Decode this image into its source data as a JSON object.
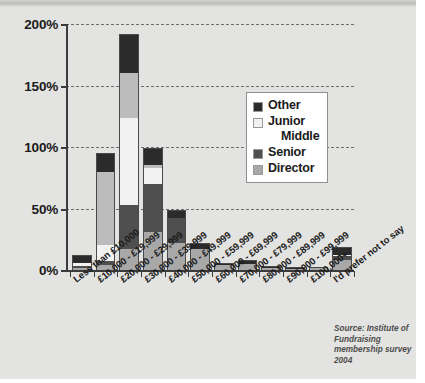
{
  "source_note": "Source: Institute of Fundraising membership survey 2004",
  "legend": {
    "title": "",
    "items": [
      {
        "label": "Other",
        "label_line2": "",
        "color": "#2b2b2b"
      },
      {
        "label": "Junior",
        "label_line2": "Middle",
        "color": "#f2f2f2"
      },
      {
        "label": "Senior",
        "label_line2": "",
        "color": "#4f4f4f"
      },
      {
        "label": "Director",
        "label_line2": "",
        "color": "#a8a8a8"
      }
    ]
  },
  "chart_data": {
    "type": "bar",
    "subtype": "stacked-bar",
    "title": "",
    "xlabel": "",
    "ylabel": "",
    "ylim": [
      0,
      200
    ],
    "ytick_labels": [
      "0%",
      "50%",
      "100%",
      "150%",
      "200%"
    ],
    "ytick_values": [
      0,
      50,
      100,
      150,
      200
    ],
    "grid": "horizontal-dashed",
    "legend_position": "inside-right",
    "categories": [
      "Less than £10,000",
      "£10,000 - £19,999",
      "£20,000 - £29,999",
      "£30,000 - £39,999",
      "£40,000 - £49,999",
      "£50,000 - £59,999",
      "£60,000 - £69,999",
      "£70,000 - £79,999",
      "£80,000 - £89,999",
      "£90,000 - £99,999",
      "£100,000+",
      "I'd prefer not to say"
    ],
    "series": [
      {
        "name": "Director",
        "color": "#a8a8a8",
        "values": [
          2,
          4,
          17,
          31,
          22,
          17,
          4,
          5,
          2,
          0.7,
          1.5,
          8
        ]
      },
      {
        "name": "Senior",
        "color": "#4f4f4f",
        "values": [
          1.5,
          3,
          36,
          39,
          20,
          0,
          0,
          0,
          0,
          0,
          0,
          3
        ]
      },
      {
        "name": "Junior Middle",
        "color": "#f2f2f2",
        "values": [
          2,
          13,
          71,
          13,
          0,
          0,
          0,
          0,
          0,
          0,
          0,
          1.5
        ]
      },
      {
        "name": "Junior",
        "color": "#bcbcbc",
        "values": [
          0,
          60,
          36,
          2,
          0,
          0,
          0,
          0,
          0,
          0,
          0,
          0
        ]
      },
      {
        "name": "Other",
        "color": "#2b2b2b",
        "values": [
          6.5,
          15,
          32,
          14,
          7,
          5,
          1.5,
          3,
          0.7,
          0.4,
          0.7,
          6
        ]
      }
    ],
    "totals": [
      12,
      95,
      192,
      99,
      49,
      22,
      5.5,
      8,
      2.7,
      1.1,
      2.2,
      18.5
    ]
  }
}
